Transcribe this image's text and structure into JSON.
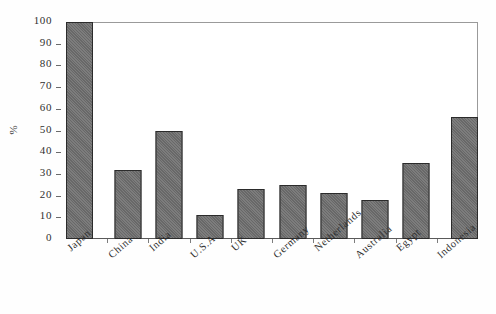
{
  "chart_data": {
    "type": "bar",
    "title": "",
    "subtitle": "",
    "xlabel": "",
    "ylabel": "%",
    "ylim": [
      0,
      100
    ],
    "grid": false,
    "legend": false,
    "legend_position": "none",
    "orientation": "vertical",
    "categories": [
      "Japan",
      "China",
      "India",
      "U.S.A.",
      "UK",
      "Germany",
      "Netherlands",
      "Australia",
      "Egypt",
      "Indonesia"
    ],
    "values": [
      100,
      32,
      50,
      11,
      23,
      25,
      21,
      18,
      35,
      56
    ],
    "y_tick_labels": [
      "100",
      "90",
      "80",
      "70",
      "60",
      "50",
      "40",
      "30",
      "20",
      "10",
      "0"
    ],
    "y_tick_values": [
      100,
      90,
      80,
      70,
      60,
      50,
      40,
      30,
      20,
      10,
      0
    ],
    "bar_color": "#6e6e6e",
    "bar_edge_color": "#2b2b2b",
    "axis_color": "#5a5a5a",
    "frame_color": "#9a9a9a",
    "background_color": "#ffffff",
    "annotations": []
  }
}
